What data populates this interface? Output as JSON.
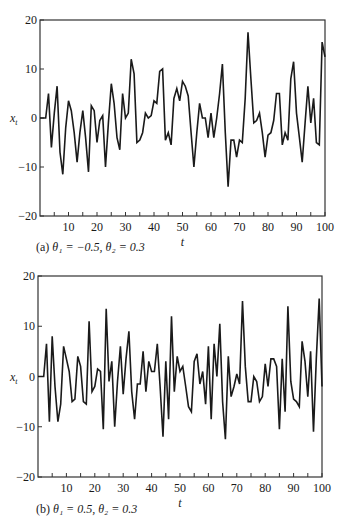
{
  "chart_data": [
    {
      "type": "line",
      "title": "",
      "caption": "(a) θ₁ = −0.5, θ₂ = 0.3",
      "xlabel": "t",
      "ylabel": "x_t",
      "xlim": [
        0,
        100
      ],
      "ylim": [
        -20,
        20
      ],
      "xticks": [
        10,
        20,
        30,
        40,
        50,
        60,
        70,
        80,
        90,
        100
      ],
      "yticks": [
        -20,
        -10,
        0,
        10,
        20
      ],
      "grid": false,
      "legend": null,
      "x": [
        0,
        1,
        2,
        3,
        4,
        5,
        6,
        7,
        8,
        9,
        10,
        11,
        12,
        13,
        14,
        15,
        16,
        17,
        18,
        19,
        20,
        21,
        22,
        23,
        24,
        25,
        26,
        27,
        28,
        29,
        30,
        31,
        32,
        33,
        34,
        35,
        36,
        37,
        38,
        39,
        40,
        41,
        42,
        43,
        44,
        45,
        46,
        47,
        48,
        49,
        50,
        51,
        52,
        53,
        54,
        55,
        56,
        57,
        58,
        59,
        60,
        61,
        62,
        63,
        64,
        65,
        66,
        67,
        68,
        69,
        70,
        71,
        72,
        73,
        74,
        75,
        76,
        77,
        78,
        79,
        80,
        81,
        82,
        83,
        84,
        85,
        86,
        87,
        88,
        89,
        90,
        91,
        92,
        93,
        94,
        95,
        96,
        97,
        98,
        99,
        100
      ],
      "series": [
        {
          "name": "x_t",
          "values": [
            0,
            0,
            0,
            5,
            -6,
            1,
            6.5,
            -7,
            -11.5,
            -2,
            3.5,
            1.5,
            -3,
            -9,
            -3,
            1.5,
            -4,
            -11,
            2.5,
            1.5,
            -5,
            -0.5,
            0.5,
            -10,
            -1,
            7,
            3,
            -4,
            -6.5,
            5,
            0,
            1,
            12,
            9,
            -5,
            -4.5,
            -3,
            1,
            0,
            0.5,
            3.5,
            3,
            9.5,
            10,
            -4.5,
            -3,
            -5.5,
            4,
            6,
            3.5,
            7.5,
            6.5,
            4.5,
            -3,
            -10,
            -3,
            3,
            0,
            0,
            -4,
            1,
            -4,
            0,
            5,
            11,
            -3,
            -14,
            -4.5,
            -4.5,
            -8,
            -4.5,
            -5,
            4,
            17.5,
            8,
            -1,
            -0.5,
            1,
            -3,
            -8,
            -3.5,
            -3,
            -0.5,
            5,
            5,
            -5.5,
            -3,
            -4.5,
            8,
            11.5,
            1,
            -4,
            -9,
            -1,
            6.5,
            -1,
            4,
            -5,
            -5.5,
            15.5,
            12.5
          ]
        }
      ]
    },
    {
      "type": "line",
      "title": "",
      "caption": "(b) θ₁ = 0.5, θ₂ = 0.3",
      "xlabel": "t",
      "ylabel": "x_t",
      "xlim": [
        0,
        100
      ],
      "ylim": [
        -20,
        20
      ],
      "xticks": [
        10,
        20,
        30,
        40,
        50,
        60,
        70,
        80,
        90,
        100
      ],
      "yticks": [
        -20,
        -10,
        0,
        10,
        20
      ],
      "grid": false,
      "legend": null,
      "x": [
        0,
        1,
        2,
        3,
        4,
        5,
        6,
        7,
        8,
        9,
        10,
        11,
        12,
        13,
        14,
        15,
        16,
        17,
        18,
        19,
        20,
        21,
        22,
        23,
        24,
        25,
        26,
        27,
        28,
        29,
        30,
        31,
        32,
        33,
        34,
        35,
        36,
        37,
        38,
        39,
        40,
        41,
        42,
        43,
        44,
        45,
        46,
        47,
        48,
        49,
        50,
        51,
        52,
        53,
        54,
        55,
        56,
        57,
        58,
        59,
        60,
        61,
        62,
        63,
        64,
        65,
        66,
        67,
        68,
        69,
        70,
        71,
        72,
        73,
        74,
        75,
        76,
        77,
        78,
        79,
        80,
        81,
        82,
        83,
        84,
        85,
        86,
        87,
        88,
        89,
        90,
        91,
        92,
        93,
        94,
        95,
        96,
        97,
        98,
        99,
        100
      ],
      "series": [
        {
          "name": "x_t",
          "values": [
            0,
            0,
            0,
            6.5,
            -9,
            8,
            -2,
            -9,
            -5.5,
            6,
            3.5,
            1,
            -5,
            -4.5,
            4,
            2,
            -5,
            -5.5,
            11,
            -3,
            -2,
            1.5,
            1,
            -10.5,
            13.5,
            -1,
            3,
            -10,
            -1,
            6,
            -3.5,
            3.5,
            9,
            -3,
            -8.5,
            -1.5,
            -1.5,
            5,
            -3,
            3,
            1,
            1,
            6.5,
            -2,
            -12,
            3,
            -8.5,
            12,
            -3,
            4,
            1,
            2,
            -2,
            -6,
            -7,
            3,
            4.5,
            -1.5,
            1,
            -5.5,
            6,
            -8.5,
            6.5,
            0,
            10.5,
            -5,
            -12.5,
            4,
            -4,
            -2,
            0.5,
            -1.5,
            15,
            2,
            -5,
            -5,
            0,
            -1,
            -5,
            -4,
            2.5,
            -2,
            3.5,
            3.5,
            2,
            -10.5,
            3.5,
            -7,
            14,
            -1,
            -4.5,
            -5,
            -6,
            7,
            3,
            -4,
            5,
            -11,
            3.5,
            15.5,
            -2
          ]
        }
      ]
    }
  ],
  "panels": {
    "a": {
      "caption_prefix": "(a) ",
      "caption_body": "θ₁ = −0.5, θ₂ = 0.3",
      "xlabel": "t",
      "ylabel": "x",
      "ylabel_sub": "t"
    },
    "b": {
      "caption_prefix": "(b) ",
      "caption_body": "θ₁ = 0.5, θ₂ = 0.3",
      "xlabel": "t",
      "ylabel": "x",
      "ylabel_sub": "t"
    }
  },
  "style": {
    "line_color": "#1a1a1a",
    "axis_color": "#333333",
    "background": "#ffffff"
  }
}
